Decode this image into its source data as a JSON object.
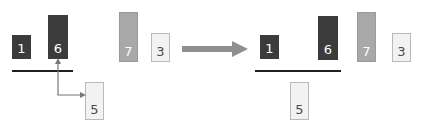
{
  "diagram": {
    "canvas": {
      "width": 427,
      "height": 135,
      "background": "#ffffff"
    },
    "palette": {
      "dark": "#3b3b3b",
      "mid": "#a8a8a8",
      "light": "#f2f2f2",
      "light_border": "#b9b9b9",
      "rule": "#1f1f1f",
      "connector": "#777777",
      "big_arrow": "#8f8f8f",
      "label_on_dark": "#ffffff",
      "label_on_light": "#4a4a4a"
    },
    "before": {
      "name": "before-state",
      "bars": [
        {
          "label": "1",
          "shade": "dark",
          "x": 12,
          "y": 35,
          "w": 19,
          "h": 24
        },
        {
          "label": "6",
          "shade": "dark",
          "x": 48,
          "y": 15,
          "w": 20,
          "h": 44
        },
        {
          "label": "7",
          "shade": "mid",
          "x": 119,
          "y": 12,
          "w": 19,
          "h": 50
        },
        {
          "label": "3",
          "shade": "light",
          "x": 151,
          "y": 33,
          "w": 19,
          "h": 29
        },
        {
          "label": "5",
          "shade": "light",
          "x": 85,
          "y": 82,
          "w": 19,
          "h": 38
        }
      ],
      "rule": {
        "x": 12,
        "y": 70,
        "w": 61
      },
      "connector": {
        "from": "6",
        "to": "5",
        "head_up": true,
        "head_right": true
      }
    },
    "after": {
      "name": "after-state",
      "bars": [
        {
          "label": "1",
          "shade": "dark",
          "x": 260,
          "y": 35,
          "w": 19,
          "h": 24
        },
        {
          "label": "6",
          "shade": "dark",
          "x": 318,
          "y": 16,
          "w": 20,
          "h": 44
        },
        {
          "label": "7",
          "shade": "mid",
          "x": 357,
          "y": 12,
          "w": 19,
          "h": 50
        },
        {
          "label": "3",
          "shade": "light",
          "x": 392,
          "y": 33,
          "w": 19,
          "h": 29
        },
        {
          "label": "5",
          "shade": "light",
          "x": 290,
          "y": 82,
          "w": 19,
          "h": 38
        }
      ],
      "rule": {
        "x": 255,
        "y": 70,
        "w": 86
      }
    },
    "transition_arrow": {
      "x": 182,
      "y": 42,
      "w": 64,
      "h": 13
    }
  }
}
